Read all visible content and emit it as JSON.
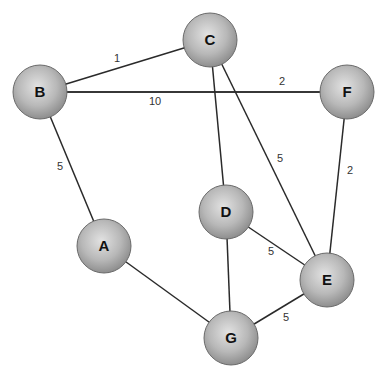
{
  "diagram": {
    "type": "weighted-graph",
    "node_color": "#b3b3b3",
    "edge_color": "#2a2a2a",
    "nodes": [
      {
        "id": "A",
        "label": "A",
        "x": 104,
        "y": 246
      },
      {
        "id": "B",
        "label": "B",
        "x": 40,
        "y": 92
      },
      {
        "id": "C",
        "label": "C",
        "x": 210,
        "y": 40
      },
      {
        "id": "D",
        "label": "D",
        "x": 226,
        "y": 212
      },
      {
        "id": "E",
        "label": "E",
        "x": 327,
        "y": 280
      },
      {
        "id": "F",
        "label": "F",
        "x": 347,
        "y": 92
      },
      {
        "id": "G",
        "label": "G",
        "x": 231,
        "y": 338
      }
    ],
    "edges": [
      {
        "from": "B",
        "to": "C",
        "weight": "1",
        "lx": 117,
        "ly": 62
      },
      {
        "from": "B",
        "to": "F",
        "weight": "10",
        "lx": 155,
        "ly": 105
      },
      {
        "from": "B",
        "to": "F",
        "weight": "2",
        "lx": 282,
        "ly": 85
      },
      {
        "from": "B",
        "to": "A",
        "weight": "5",
        "lx": 60,
        "ly": 170
      },
      {
        "from": "C",
        "to": "D",
        "weight": "",
        "lx": 0,
        "ly": 0
      },
      {
        "from": "C",
        "to": "E",
        "weight": "5",
        "lx": 280,
        "ly": 162
      },
      {
        "from": "F",
        "to": "E",
        "weight": "2",
        "lx": 350,
        "ly": 174
      },
      {
        "from": "D",
        "to": "E",
        "weight": "5",
        "lx": 271,
        "ly": 255
      },
      {
        "from": "D",
        "to": "G",
        "weight": "",
        "lx": 0,
        "ly": 0
      },
      {
        "from": "A",
        "to": "G",
        "weight": "",
        "lx": 0,
        "ly": 0
      },
      {
        "from": "G",
        "to": "E",
        "weight": "5",
        "lx": 286,
        "ly": 321
      }
    ]
  }
}
